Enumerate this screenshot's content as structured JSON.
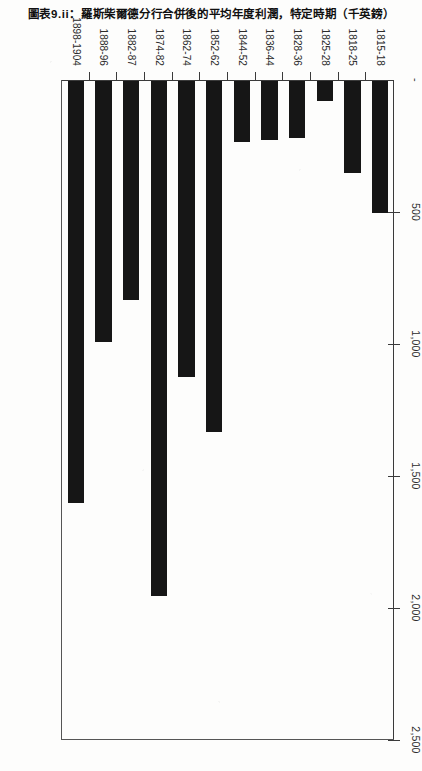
{
  "chart_data": {
    "type": "bar",
    "orientation": "horizontal",
    "title": "圖表9.ii：羅斯柴爾德分行合併後的平均年度利潤，特定時期（千英鎊）",
    "xlabel": "",
    "ylabel": "",
    "xlim": [
      0,
      2500
    ],
    "grid": false,
    "legend": null,
    "axis_tick_labels": [
      "-",
      "500",
      "1,000",
      "1,500",
      "2,000",
      "2,500"
    ],
    "axis_tick_values": [
      0,
      500,
      1000,
      1500,
      2000,
      2500
    ],
    "categories": [
      "1815-18",
      "1818-25",
      "1825-28",
      "1828-36",
      "1836-44",
      "1844-52",
      "1852-62",
      "1862-74",
      "1874-82",
      "1882-87",
      "1888-96",
      "1898-1904"
    ],
    "values": [
      500,
      350,
      75,
      215,
      225,
      230,
      1330,
      1120,
      1950,
      830,
      990,
      1600
    ],
    "series": [
      {
        "name": "平均年度利潤（千英鎊）",
        "values": [
          500,
          350,
          75,
          215,
          225,
          230,
          1330,
          1120,
          1950,
          830,
          990,
          1600
        ]
      }
    ],
    "bar_color": "#161616"
  },
  "figure": {
    "rotation_degrees": 90,
    "paper": "#fdfdfc",
    "axis_color": "#3a3a3a"
  }
}
